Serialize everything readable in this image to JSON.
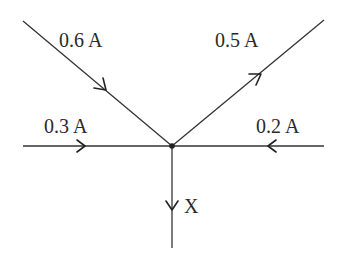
{
  "diagram": {
    "type": "circuit-junction",
    "junction": {
      "x": 172,
      "y": 146
    },
    "colors": {
      "line": "#333333",
      "text": "#2a2a2a",
      "background": "#ffffff"
    },
    "branches": [
      {
        "id": "upper-left",
        "label": "0.6 A",
        "direction": "into junction",
        "from": [
          23,
          21
        ],
        "to": [
          172,
          146
        ]
      },
      {
        "id": "upper-right",
        "label": "0.5 A",
        "direction": "out of junction",
        "from": [
          172,
          146
        ],
        "to": [
          324,
          20
        ]
      },
      {
        "id": "left",
        "label": "0.3 A",
        "direction": "into junction",
        "from": [
          23,
          146
        ],
        "to": [
          172,
          146
        ]
      },
      {
        "id": "right",
        "label": "0.2 A",
        "direction": "into junction",
        "from": [
          324,
          146
        ],
        "to": [
          172,
          146
        ]
      },
      {
        "id": "bottom",
        "label": "X",
        "direction": "out of junction",
        "from": [
          172,
          146
        ],
        "to": [
          172,
          248
        ]
      }
    ]
  }
}
